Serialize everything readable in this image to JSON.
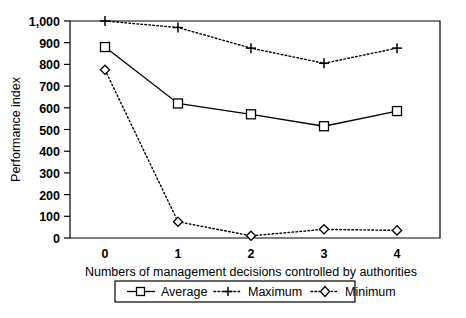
{
  "chart_data": {
    "type": "line",
    "title": "",
    "xlabel": "Numbers of management decisions controlled by authorities",
    "ylabel": "Performance index",
    "x": [
      0,
      1,
      2,
      3,
      4
    ],
    "categories": [
      "0",
      "1",
      "2",
      "3",
      "4"
    ],
    "xtick_labels": [
      "0",
      "1",
      "2",
      "3",
      "4"
    ],
    "ytick_labels": [
      "0",
      "100",
      "200",
      "300",
      "400",
      "500",
      "600",
      "700",
      "800",
      "900",
      "1,000"
    ],
    "ytick_values": [
      0,
      100,
      200,
      300,
      400,
      500,
      600,
      700,
      800,
      900,
      1000
    ],
    "ylim": [
      0,
      1000
    ],
    "xlim": [
      -0.35,
      4.35
    ],
    "grid": false,
    "legend_position": "below-bottom-center",
    "series": [
      {
        "name": "Average",
        "values": [
          880,
          620,
          570,
          515,
          585
        ],
        "line_style": "solid",
        "marker": "open-square"
      },
      {
        "name": "Maximum",
        "values": [
          1000,
          970,
          875,
          805,
          875
        ],
        "line_style": "dotted",
        "marker": "plus"
      },
      {
        "name": "Minimum",
        "values": [
          775,
          75,
          10,
          40,
          35
        ],
        "line_style": "dotted",
        "marker": "open-diamond"
      }
    ],
    "colors": {
      "ink": "#000000",
      "background": "#ffffff"
    }
  },
  "axes": {
    "y_title": "Performance index",
    "x_title": "Numbers of management decisions controlled by authorities",
    "y_ticks": [
      "1,000",
      "900",
      "800",
      "700",
      "600",
      "500",
      "400",
      "300",
      "200",
      "100",
      "0"
    ],
    "x_ticks": [
      "0",
      "1",
      "2",
      "3",
      "4"
    ]
  },
  "legend": {
    "items": [
      {
        "label": "Average"
      },
      {
        "label": "Maximum"
      },
      {
        "label": "Minimum"
      }
    ]
  }
}
